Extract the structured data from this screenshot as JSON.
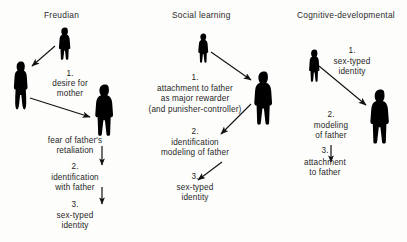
{
  "figure": {
    "title_row": {
      "freudian": "Freudian",
      "social_learning": "Social learning",
      "cognitive": "Cognitive-developmental"
    },
    "columns": [
      {
        "id": "freudian",
        "title": "Freudian",
        "figures": [
          {
            "role": "child",
            "name": "child-figure"
          },
          {
            "role": "mother",
            "name": "mother-figure"
          },
          {
            "role": "father",
            "name": "father-figure"
          }
        ],
        "steps": [
          {
            "num": "1.",
            "lines": [
              "desire for",
              "mother"
            ]
          },
          {
            "num": "",
            "lines": [
              "fear of father's",
              "retaliation"
            ]
          },
          {
            "num": "2.",
            "lines": [
              "identification",
              "with father"
            ]
          },
          {
            "num": "3.",
            "lines": [
              "sex-typed",
              "identity"
            ]
          }
        ]
      },
      {
        "id": "social_learning",
        "title": "Social learning",
        "figures": [
          {
            "role": "child",
            "name": "child-figure"
          },
          {
            "role": "father",
            "name": "father-figure"
          }
        ],
        "steps": [
          {
            "num": "1.",
            "lines": [
              "attachment to father",
              "as major rewarder",
              "(and punisher-controller)"
            ]
          },
          {
            "num": "2.",
            "lines": [
              "identification",
              "modeling of father"
            ]
          },
          {
            "num": "3.",
            "lines": [
              "sex-typed",
              "identity"
            ]
          }
        ]
      },
      {
        "id": "cognitive",
        "title": "Cognitive-developmental",
        "figures": [
          {
            "role": "child",
            "name": "child-figure"
          },
          {
            "role": "father",
            "name": "father-figure"
          }
        ],
        "steps": [
          {
            "num": "1.",
            "lines": [
              "sex-typed",
              "identity"
            ]
          },
          {
            "num": "2.",
            "lines": [
              "modeling",
              "of father"
            ]
          },
          {
            "num": "3.",
            "lines": [
              "attachment",
              "to father"
            ]
          }
        ]
      }
    ],
    "colors": {
      "silhouette": "#000000",
      "arrow": "#111111",
      "text": "#1f1f1f",
      "background": "#fdfdfc"
    }
  }
}
